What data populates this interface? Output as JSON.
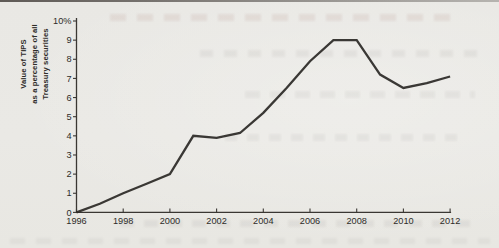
{
  "figure": {
    "y_axis_title_lines": [
      "Value of TIPS",
      "as a percentage of all",
      "Treasury securities"
    ]
  },
  "chart_data": {
    "type": "line",
    "x": [
      1996,
      1997,
      1998,
      1999,
      2000,
      2001,
      2002,
      2003,
      2004,
      2005,
      2006,
      2007,
      2008,
      2009,
      2010,
      2011,
      2012
    ],
    "values": [
      0,
      0.45,
      1.0,
      1.5,
      2.0,
      4.0,
      3.9,
      4.15,
      5.2,
      6.5,
      7.9,
      9.0,
      9.0,
      7.2,
      6.5,
      6.75,
      7.1
    ],
    "series_name": "Value of TIPS as a percentage of all Treasury securities",
    "title": "",
    "xlabel": "",
    "ylabel": "Value of TIPS as a percentage of all Treasury securities",
    "xlim": [
      1996,
      2012
    ],
    "ylim": [
      0,
      10
    ],
    "x_tick_years": [
      1996,
      1998,
      2000,
      2002,
      2004,
      2006,
      2008,
      2010,
      2012
    ],
    "y_ticks": [
      0,
      1,
      2,
      3,
      4,
      5,
      6,
      7,
      8,
      9,
      10
    ],
    "y_tick_labels": [
      "0",
      "1",
      "2",
      "3",
      "4",
      "5",
      "6",
      "7",
      "8",
      "9",
      "10%"
    ],
    "grid": false,
    "legend": "none",
    "line_color": "#2c2a27",
    "axis_color": "#3a3733",
    "text_color": "#2e2c29",
    "background_color": "#e9e8e4"
  }
}
